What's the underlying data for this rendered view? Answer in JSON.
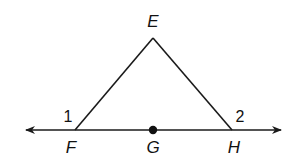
{
  "diagram": {
    "points": {
      "E": {
        "label": "E",
        "x": 153,
        "y": 38
      },
      "F": {
        "label": "F",
        "x": 75,
        "y": 130
      },
      "G": {
        "label": "G",
        "x": 153,
        "y": 130
      },
      "H": {
        "label": "H",
        "x": 232,
        "y": 130
      }
    },
    "angles": {
      "angle1": {
        "label": "1"
      },
      "angle2": {
        "label": "2"
      }
    },
    "colors": {
      "stroke": "#1a1a1a",
      "background": "#ffffff"
    }
  }
}
